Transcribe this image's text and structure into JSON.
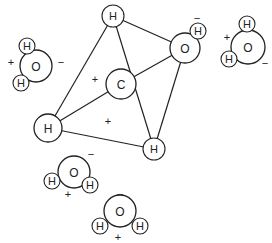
{
  "diagram": {
    "title": "",
    "bonds": [
      {
        "from": "H_top",
        "to": "H_left"
      },
      {
        "from": "H_top",
        "to": "O_center"
      },
      {
        "from": "H_top",
        "to": "H_br"
      },
      {
        "from": "C",
        "to": "H_left"
      },
      {
        "from": "C",
        "to": "O_center"
      },
      {
        "from": "H_left",
        "to": "H_br"
      },
      {
        "from": "O_center",
        "to": "H_br"
      }
    ],
    "atoms": [
      {
        "id": "H_top",
        "label": "H",
        "x": 113,
        "y": 16,
        "r": 11
      },
      {
        "id": "C",
        "label": "C",
        "x": 121,
        "y": 84,
        "r": 15
      },
      {
        "id": "H_left",
        "label": "H",
        "x": 48,
        "y": 128,
        "r": 14
      },
      {
        "id": "H_br",
        "label": "H",
        "x": 154,
        "y": 149,
        "r": 11
      },
      {
        "id": "O_center",
        "label": "O",
        "x": 185,
        "y": 48,
        "r": 15
      },
      {
        "id": "O_center_H",
        "label": "H",
        "x": 198,
        "y": 31,
        "r": 8
      }
    ],
    "charges": [
      {
        "sign": "+",
        "x": 95,
        "y": 79
      },
      {
        "sign": "+",
        "x": 108,
        "y": 121
      },
      {
        "sign": "−",
        "x": 197,
        "y": 18
      }
    ],
    "waters": [
      {
        "name": "water-top-left",
        "O": {
          "label": "O",
          "x": 36,
          "y": 66,
          "r": 16
        },
        "H1": {
          "label": "H",
          "x": 27,
          "y": 46,
          "r": 8
        },
        "H2": {
          "label": "H",
          "x": 21,
          "y": 83,
          "r": 8
        },
        "plus": {
          "sign": "+",
          "x": 11,
          "y": 62
        },
        "minus": {
          "sign": "−",
          "x": 61,
          "y": 62
        }
      },
      {
        "name": "water-top-right",
        "O": {
          "label": "O",
          "x": 248,
          "y": 47,
          "r": 17
        },
        "H1": {
          "label": "H",
          "x": 247,
          "y": 24,
          "r": 8
        },
        "H2": {
          "label": "H",
          "x": 229,
          "y": 59,
          "r": 8
        },
        "plus": {
          "sign": "+",
          "x": 227,
          "y": 37
        },
        "minus": {
          "sign": "−",
          "x": 265,
          "y": 63
        }
      },
      {
        "name": "water-lower-left",
        "O": {
          "label": "O",
          "x": 74,
          "y": 172,
          "r": 16
        },
        "H1": {
          "label": "H",
          "x": 52,
          "y": 181,
          "r": 8
        },
        "H2": {
          "label": "H",
          "x": 90,
          "y": 185,
          "r": 8
        },
        "plus": {
          "sign": "+",
          "x": 68,
          "y": 194
        },
        "minus": {
          "sign": "−",
          "x": 91,
          "y": 154
        }
      },
      {
        "name": "water-bottom",
        "O": {
          "label": "O",
          "x": 120,
          "y": 211,
          "r": 16
        },
        "H1": {
          "label": "H",
          "x": 100,
          "y": 226,
          "r": 8
        },
        "H2": {
          "label": "H",
          "x": 140,
          "y": 226,
          "r": 8
        },
        "plus": {
          "sign": "+",
          "x": 118,
          "y": 237
        },
        "minus": {
          "sign": "−",
          "x": 120,
          "y": 194
        }
      }
    ],
    "colors": {
      "stroke": "#222222",
      "fill": "#ffffff",
      "text": "#222222"
    }
  }
}
